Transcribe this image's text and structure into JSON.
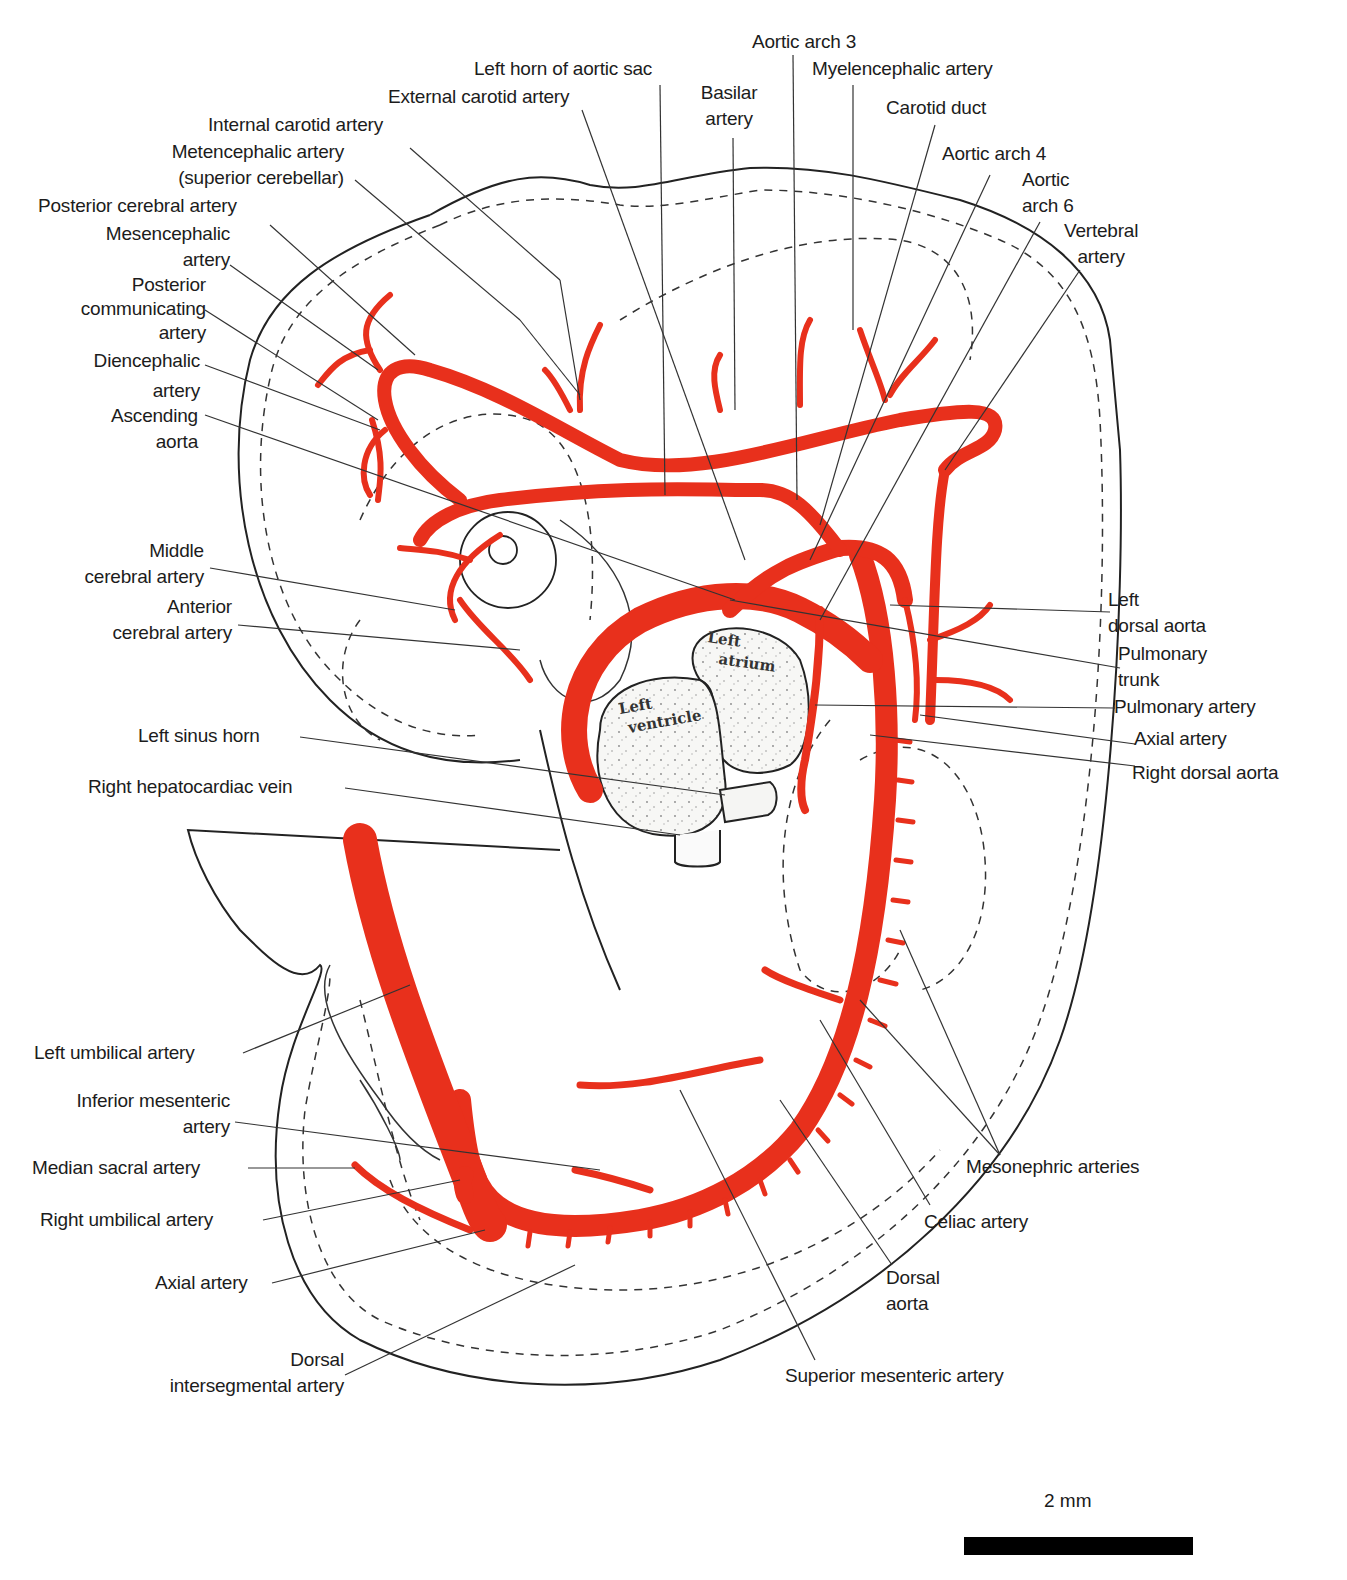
{
  "figure": {
    "type": "anatomical-diagram",
    "accent_color": "#e8301c",
    "outline_color": "#222222"
  },
  "labels": {
    "aortic_arch_3": "Aortic arch 3",
    "left_horn_aortic_sac": "Left horn of aortic sac",
    "myelencephalic_artery": "Myelencephalic artery",
    "external_carotid_artery": "External carotid artery",
    "basilar_artery_1": "Basilar",
    "basilar_artery_2": "artery",
    "carotid_duct": "Carotid duct",
    "internal_carotid_artery": "Internal carotid artery",
    "metencephalic_artery_1": "Metencephalic artery",
    "metencephalic_artery_2": "(superior cerebellar)",
    "aortic_arch_4": "Aortic arch 4",
    "aortic_arch_6_1": "Aortic",
    "aortic_arch_6_2": "arch 6",
    "posterior_cerebral_artery": "Posterior cerebral artery",
    "vertebral_artery_1": "Vertebral",
    "vertebral_artery_2": "artery",
    "mesencephalic_artery_1": "Mesencephalic",
    "mesencephalic_artery_2": "artery",
    "posterior_communicating_1": "Posterior",
    "posterior_communicating_2": "communicating",
    "posterior_communicating_3": "artery",
    "diencephalic_artery_1": "Diencephalic",
    "diencephalic_artery_2": "artery",
    "ascending_aorta_1": "Ascending",
    "ascending_aorta_2": "aorta",
    "middle_cerebral_1": "Middle",
    "middle_cerebral_2": "cerebral artery",
    "anterior_cerebral_1": "Anterior",
    "anterior_cerebral_2": "cerebral artery",
    "left_dorsal_aorta_1": "Left",
    "left_dorsal_aorta_2": "dorsal aorta",
    "pulmonary_trunk_1": "Pulmonary",
    "pulmonary_trunk_2": "trunk",
    "pulmonary_artery": "Pulmonary artery",
    "axial_artery_upper": "Axial artery",
    "right_dorsal_aorta": "Right dorsal aorta",
    "left_sinus_horn": "Left sinus horn",
    "right_hepatocardiac_vein": "Right hepatocardiac vein",
    "left_umbilical_artery": "Left umbilical artery",
    "inferior_mesenteric_1": "Inferior mesenteric",
    "inferior_mesenteric_2": "artery",
    "median_sacral_artery": "Median sacral artery",
    "mesonephric_arteries": "Mesonephric arteries",
    "right_umbilical_artery": "Right umbilical artery",
    "celiac_artery": "Celiac artery",
    "axial_artery_lower": "Axial artery",
    "dorsal_aorta_1": "Dorsal",
    "dorsal_aorta_2": "aorta",
    "dorsal_intersegmental_1": "Dorsal",
    "dorsal_intersegmental_2": "intersegmental artery",
    "superior_mesenteric_artery": "Superior mesenteric artery"
  },
  "heart": {
    "left_atrium_1": "Left",
    "left_atrium_2": "atrium",
    "left_ventricle_1": "Left",
    "left_ventricle_2": "ventricle"
  },
  "scale": {
    "label": "2 mm"
  }
}
